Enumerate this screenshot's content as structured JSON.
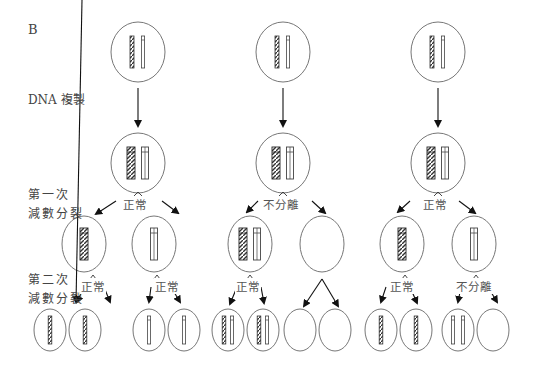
{
  "panel_label": "B",
  "stage_labels": {
    "replication": "DNA 複製",
    "meiosis1_line1": "第一次",
    "meiosis1_line2": "減數分裂",
    "meiosis2_line1": "第二次",
    "meiosis2_line2": "減數分裂"
  },
  "columns": [
    {
      "meiosis1_event": "正常",
      "meiosis2_events": [
        "正常",
        "正常"
      ]
    },
    {
      "meiosis1_event": "不分離",
      "meiosis2_events": [
        "正常",
        ""
      ]
    },
    {
      "meiosis1_event": "正常",
      "meiosis2_events": [
        "正常",
        "不分離"
      ]
    }
  ]
}
